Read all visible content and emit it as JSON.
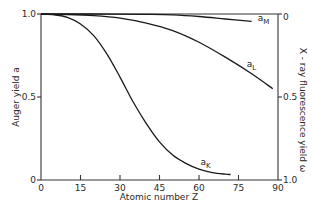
{
  "chart_data": {
    "type": "line",
    "title": "",
    "xlabel": "Atomic number Z",
    "ylabel": "Auger yield a",
    "ylabel_right": "X - ray fluorescence yield ω",
    "xlim": [
      0,
      90
    ],
    "ylim": [
      0,
      1.0
    ],
    "ylim_right": [
      1.0,
      0
    ],
    "x_ticks": [
      0,
      15,
      30,
      45,
      60,
      75,
      90
    ],
    "y_ticks": [
      "0",
      "0.5",
      "1.0"
    ],
    "y_ticks_right": [
      "1.0",
      "0.5",
      "0"
    ],
    "grid": false,
    "legend": "inline labels at curve ends",
    "series": [
      {
        "name": "a_K",
        "label_main": "a",
        "label_sub": "K",
        "x": [
          0,
          5,
          10,
          15,
          20,
          25,
          30,
          35,
          40,
          45,
          50,
          55,
          60,
          65,
          70,
          72
        ],
        "y": [
          1.0,
          0.995,
          0.98,
          0.94,
          0.87,
          0.76,
          0.62,
          0.47,
          0.34,
          0.23,
          0.15,
          0.1,
          0.065,
          0.045,
          0.035,
          0.033
        ]
      },
      {
        "name": "a_L",
        "label_main": "a",
        "label_sub": "L",
        "x": [
          0,
          10,
          20,
          30,
          40,
          50,
          60,
          70,
          80,
          88
        ],
        "y": [
          1.0,
          0.997,
          0.99,
          0.975,
          0.945,
          0.9,
          0.83,
          0.74,
          0.64,
          0.55
        ]
      },
      {
        "name": "a_M",
        "label_main": "a",
        "label_sub": "M",
        "x": [
          0,
          20,
          40,
          50,
          60,
          70,
          80
        ],
        "y": [
          1.0,
          1.0,
          0.998,
          0.995,
          0.985,
          0.97,
          0.955
        ]
      }
    ]
  },
  "axes": {
    "x_title": "Atomic number Z",
    "y_left_title": "Auger yield a",
    "y_right_title": "X - ray fluorescence yield ω"
  }
}
